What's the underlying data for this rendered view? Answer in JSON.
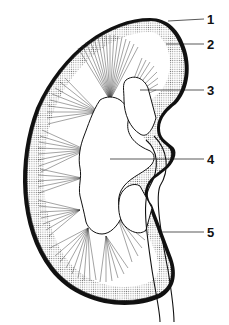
{
  "diagram": {
    "labels": [
      {
        "num": "1",
        "x": 207,
        "y": 13
      },
      {
        "num": "2",
        "x": 207,
        "y": 38
      },
      {
        "num": "3",
        "x": 207,
        "y": 84
      },
      {
        "num": "4",
        "x": 207,
        "y": 153
      },
      {
        "num": "5",
        "x": 207,
        "y": 226
      }
    ],
    "colors": {
      "ink": "#111111",
      "cortex_dots": "#888888",
      "background": "#ffffff"
    }
  }
}
